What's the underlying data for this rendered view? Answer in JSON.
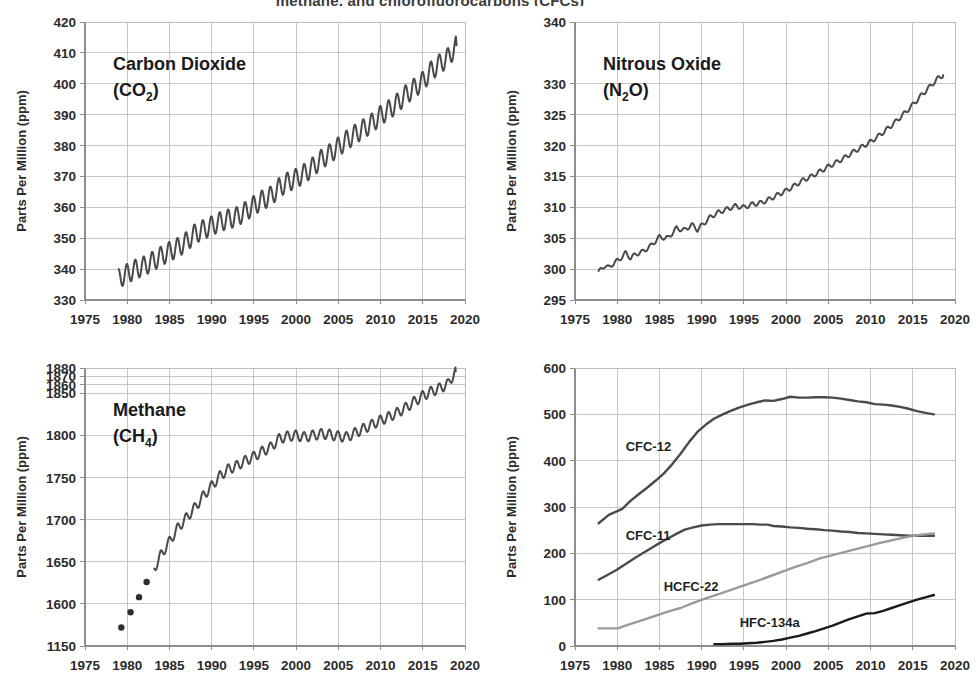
{
  "figure": {
    "title_partial": "methane, and chlorofluorocarbons (CFCs)",
    "axis_title": "Parts Per Million (ppm)",
    "xlabel": "",
    "line_color_primary": "#4a4a4a",
    "line_color_secondary": "#8a8a8a",
    "line_color_black": "#1a1a1a",
    "grid_color": "#b9b9b9"
  },
  "chart_data": [
    {
      "id": "co2",
      "type": "line",
      "title": "Carbon Dioxide",
      "subtitle": "(CO2)",
      "species_name": "Carbon Dioxide",
      "species_formula_base": "(CO",
      "species_formula_sub": "2",
      "species_formula_tail": ")",
      "ylabel": "Parts Per Million (ppm)",
      "xlabel": "",
      "xlim": [
        1975,
        2020
      ],
      "ylim": [
        330,
        420
      ],
      "grid": true,
      "xticks": [
        1975,
        1980,
        1985,
        1990,
        1995,
        2000,
        2005,
        2010,
        2015,
        2020
      ],
      "yticks": [
        330,
        340,
        350,
        360,
        370,
        380,
        390,
        400,
        410,
        420
      ],
      "legend_position": "inline-top-left",
      "series": [
        {
          "name": "CO2",
          "color": "#4a4a4a",
          "seasonal_amplitude": 3.2,
          "x": [
            1979.0,
            1980.0,
            1981.0,
            1982.0,
            1983.0,
            1984.0,
            1985.0,
            1986.0,
            1987.0,
            1988.0,
            1989.0,
            1990.0,
            1991.0,
            1992.0,
            1993.0,
            1994.0,
            1995.0,
            1996.0,
            1997.0,
            1998.0,
            1999.0,
            2000.0,
            2001.0,
            2002.0,
            2003.0,
            2004.0,
            2005.0,
            2006.0,
            2007.0,
            2008.0,
            2009.0,
            2010.0,
            2011.0,
            2012.0,
            2013.0,
            2014.0,
            2015.0,
            2016.0,
            2017.0,
            2018.0,
            2019.0
          ],
          "values": [
            337.0,
            338.6,
            340.0,
            341.0,
            342.5,
            344.2,
            345.7,
            347.0,
            348.9,
            351.4,
            352.8,
            354.0,
            355.4,
            356.2,
            357.0,
            358.7,
            360.6,
            362.4,
            363.6,
            366.4,
            368.2,
            369.4,
            371.0,
            373.1,
            375.6,
            377.4,
            379.6,
            381.8,
            383.7,
            385.5,
            387.3,
            389.8,
            391.6,
            393.8,
            396.5,
            398.6,
            400.8,
            404.2,
            406.5,
            408.5,
            412.5
          ]
        }
      ]
    },
    {
      "id": "n2o",
      "type": "line",
      "title": "Nitrous Oxide",
      "subtitle": "(N2O)",
      "species_name": "Nitrous Oxide",
      "species_formula_base": "(N",
      "species_formula_sub": "2",
      "species_formula_tail": "O)",
      "ylabel": "Parts Per Million (ppm)",
      "xlabel": "",
      "xlim": [
        1975,
        2020
      ],
      "ylim": [
        295,
        340
      ],
      "grid": true,
      "xticks": [
        1975,
        1980,
        1985,
        1990,
        1995,
        2000,
        2005,
        2010,
        2015,
        2020
      ],
      "yticks": [
        295,
        300,
        305,
        310,
        315,
        320,
        325,
        330,
        340
      ],
      "legend_position": "inline-top-left",
      "series": [
        {
          "name": "N2O",
          "color": "#4a4a4a",
          "seasonal_amplitude": 0.35,
          "x": [
            1977.8,
            1978.5,
            1979.0,
            1979.6,
            1980.2,
            1981.0,
            1981.6,
            1982.3,
            1983.0,
            1984.0,
            1985.0,
            1986.0,
            1987.0,
            1988.0,
            1988.8,
            1989.5,
            1990.2,
            1991.0,
            1992.0,
            1993.0,
            1994.0,
            1995.0,
            1996.0,
            1997.0,
            1998.0,
            1999.0,
            2000.0,
            2001.0,
            2002.0,
            2003.0,
            2004.0,
            2005.0,
            2006.0,
            2007.0,
            2008.0,
            2009.0,
            2010.0,
            2011.0,
            2012.0,
            2013.0,
            2014.0,
            2015.0,
            2016.0,
            2017.0,
            2018.0,
            2018.6
          ],
          "values": [
            299.5,
            300.6,
            300.2,
            301.0,
            301.5,
            302.6,
            301.8,
            302.5,
            302.8,
            303.8,
            305.2,
            305.0,
            306.6,
            306.3,
            307.2,
            306.4,
            307.3,
            308.4,
            309.2,
            309.7,
            310.2,
            310.0,
            310.5,
            310.7,
            311.3,
            312.0,
            312.7,
            313.5,
            314.4,
            315.0,
            315.8,
            316.6,
            317.3,
            318.1,
            319.0,
            319.8,
            320.6,
            321.6,
            322.7,
            323.9,
            325.2,
            326.6,
            328.1,
            329.5,
            330.9,
            331.4
          ]
        }
      ]
    },
    {
      "id": "ch4",
      "type": "line",
      "title": "Methane",
      "subtitle": "(CH4)",
      "species_name": "Methane",
      "species_formula_base": "(CH",
      "species_formula_sub": "4",
      "species_formula_tail": ")",
      "ylabel": "Parts Per Million (ppm)",
      "xlabel": "",
      "xlim": [
        1975,
        2020
      ],
      "ylim": [
        1550,
        1880
      ],
      "grid": true,
      "xticks": [
        1975,
        1980,
        1985,
        1990,
        1995,
        2000,
        2005,
        2010,
        2015,
        2020
      ],
      "yticks_labels": [
        "1150",
        "1600",
        "1650",
        "1700",
        "1750",
        "1800",
        "1850",
        "1860",
        "1870",
        "1880"
      ],
      "yticks_values": [
        1550,
        1600,
        1650,
        1700,
        1750,
        1800,
        1850,
        1860,
        1870,
        1880
      ],
      "legend_position": "inline-top-left",
      "marker_series": {
        "name": "CH4 early samples",
        "color": "#2e2e2e",
        "marker": "dot",
        "x": [
          1979.3,
          1980.4,
          1981.4,
          1982.3
        ],
        "values": [
          1572.0,
          1590.0,
          1608.0,
          1626.0
        ]
      },
      "series": [
        {
          "name": "CH4",
          "color": "#4a4a4a",
          "seasonal_amplitude": 6.0,
          "x": [
            1983.2,
            1984.0,
            1985.0,
            1986.0,
            1987.0,
            1988.0,
            1989.0,
            1990.0,
            1991.0,
            1992.0,
            1993.0,
            1994.0,
            1995.0,
            1996.0,
            1997.0,
            1998.0,
            1999.0,
            2000.0,
            2001.0,
            2002.0,
            2003.0,
            2004.0,
            2005.0,
            2006.0,
            2007.0,
            2008.0,
            2009.0,
            2010.0,
            2011.0,
            2012.0,
            2013.0,
            2014.0,
            2015.0,
            2016.0,
            2017.0,
            2018.0,
            2018.5,
            2018.9
          ],
          "values": [
            1642.0,
            1658.0,
            1674.0,
            1690.0,
            1702.0,
            1714.0,
            1728.0,
            1740.0,
            1752.0,
            1760.0,
            1764.0,
            1770.0,
            1775.0,
            1781.0,
            1786.0,
            1796.0,
            1799.0,
            1800.0,
            1798.0,
            1800.0,
            1802.0,
            1801.0,
            1799.0,
            1798.0,
            1803.0,
            1808.0,
            1813.0,
            1818.0,
            1822.0,
            1827.0,
            1833.0,
            1840.0,
            1847.0,
            1852.0,
            1856.0,
            1861.0,
            1870.0,
            1876.0
          ]
        }
      ]
    },
    {
      "id": "cfc",
      "type": "line",
      "title": "Halocarbons",
      "ylabel": "Parts Per Million (ppm)",
      "xlabel": "",
      "xlim": [
        1975,
        2020
      ],
      "ylim": [
        0,
        600
      ],
      "grid": true,
      "xticks": [
        1975,
        1980,
        1985,
        1990,
        1995,
        2000,
        2005,
        2010,
        2015,
        2020
      ],
      "yticks": [
        0,
        100,
        200,
        300,
        400,
        500,
        600
      ],
      "legend_position": "inline-labels",
      "series": [
        {
          "name": "CFC-12",
          "color": "#4a4a4a",
          "label_x": 1981.0,
          "label_y": 420,
          "label_weight": "600",
          "x": [
            1977.8,
            1979.0,
            1980.0,
            1980.6,
            1981.5,
            1982.5,
            1983.5,
            1984.5,
            1985.5,
            1986.5,
            1987.5,
            1988.5,
            1989.5,
            1990.5,
            1991.5,
            1992.5,
            1993.5,
            1994.5,
            1995.5,
            1996.5,
            1997.5,
            1998.5,
            1999.5,
            2000.5,
            2001.5,
            2002.5,
            2003.5,
            2004.5,
            2005.5,
            2006.5,
            2007.5,
            2008.5,
            2009.5,
            2010.5,
            2011.5,
            2012.5,
            2013.5,
            2014.5,
            2015.5,
            2016.5,
            2017.5
          ],
          "values": [
            265,
            283,
            291,
            296,
            312,
            327,
            341,
            356,
            372,
            392,
            415,
            440,
            462,
            478,
            491,
            500,
            508,
            515,
            521,
            526,
            530,
            529,
            533,
            538,
            536,
            536,
            537,
            537,
            536,
            534,
            531,
            528,
            526,
            522,
            521,
            519,
            516,
            512,
            507,
            503,
            500
          ]
        },
        {
          "name": "CFC-11",
          "color": "#4a4a4a",
          "label_x": 1981.0,
          "label_y": 228,
          "label_weight": "600",
          "x": [
            1977.8,
            1979.0,
            1980.0,
            1981.0,
            1982.0,
            1983.0,
            1984.0,
            1985.0,
            1986.0,
            1987.0,
            1988.0,
            1989.0,
            1990.0,
            1991.0,
            1992.0,
            1993.0,
            1994.0,
            1995.0,
            1996.0,
            1997.0,
            1997.8,
            1998.5,
            1999.5,
            2000.5,
            2001.5,
            2002.5,
            2003.5,
            2004.5,
            2005.5,
            2006.5,
            2007.5,
            2008.5,
            2009.5,
            2010.5,
            2011.5,
            2012.5,
            2013.5,
            2014.5,
            2015.5,
            2016.5,
            2017.5
          ],
          "values": [
            143,
            155,
            165,
            177,
            189,
            200,
            211,
            222,
            232,
            242,
            251,
            256,
            260,
            262,
            263,
            263,
            263,
            263,
            263,
            262,
            262,
            259,
            258,
            256,
            255,
            253,
            252,
            250,
            249,
            247,
            246,
            244,
            243,
            242,
            241,
            240,
            239,
            238,
            238,
            238,
            238
          ]
        },
        {
          "name": "HCFC-22",
          "color": "#9a9a9a",
          "label_x": 1985.5,
          "label_y": 118,
          "label_weight": "600",
          "x": [
            1977.8,
            1979.0,
            1980.0,
            1980.4,
            1981.5,
            1983.0,
            1984.5,
            1986.0,
            1987.5,
            1989.0,
            1990.5,
            1992.0,
            1993.5,
            1995.0,
            1996.5,
            1998.0,
            1999.5,
            2001.0,
            2002.5,
            2004.0,
            2005.5,
            2007.0,
            2008.5,
            2010.0,
            2011.5,
            2013.0,
            2014.5,
            2016.0,
            2017.5
          ],
          "values": [
            38,
            38,
            38,
            40,
            47,
            56,
            65,
            74,
            82,
            93,
            103,
            112,
            121,
            131,
            140,
            150,
            160,
            170,
            179,
            189,
            196,
            203,
            210,
            217,
            224,
            230,
            236,
            240,
            243
          ]
        },
        {
          "name": "HFC-134a",
          "color": "#1a1a1a",
          "label_x": 1994.5,
          "label_y": 42,
          "label_weight": "700",
          "x": [
            1991.5,
            1992.5,
            1993.5,
            1994.5,
            1995.5,
            1996.5,
            1997.5,
            1998.5,
            1999.5,
            2000.5,
            2001.5,
            2002.5,
            2003.5,
            2004.5,
            2005.5,
            2006.5,
            2007.5,
            2008.5,
            2009.5,
            2010.5,
            2011.5,
            2012.5,
            2013.5,
            2014.5,
            2015.5,
            2016.5,
            2017.5
          ],
          "values": [
            4,
            4,
            5,
            5,
            6,
            7,
            9,
            11,
            14,
            18,
            22,
            27,
            32,
            38,
            44,
            51,
            58,
            64,
            70,
            71,
            76,
            82,
            88,
            94,
            100,
            105,
            110
          ]
        }
      ]
    }
  ]
}
